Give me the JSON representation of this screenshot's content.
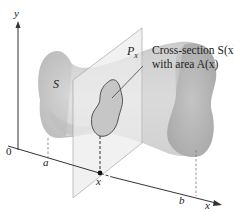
{
  "diagram": {
    "type": "solid-cross-section",
    "axes": {
      "y_label": "y",
      "x_label": "x",
      "origin_label": "0"
    },
    "solid_label": "S",
    "plane_label": "P",
    "plane_subscript": "x",
    "callout": {
      "line1": "Cross-section S(x)",
      "line2": "with area A(x)"
    },
    "x_ticks": {
      "a": "a",
      "x": "x",
      "b": "b"
    },
    "colors": {
      "solid_fill": "#c4c4c4",
      "solid_light": "#dcdcdc",
      "end_cap": "#b8b8b8",
      "plane_fill": "#e8e8e8",
      "axis": "#333333",
      "text": "#222222"
    }
  }
}
